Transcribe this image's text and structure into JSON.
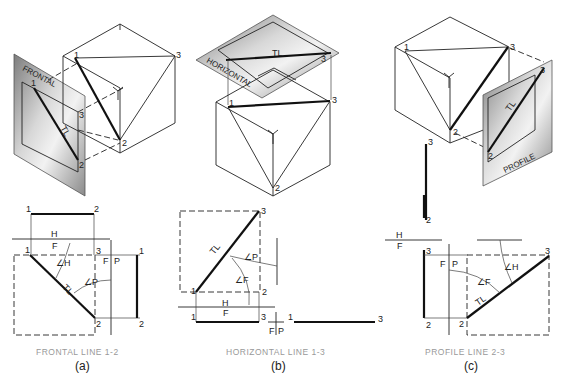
{
  "figure": {
    "panels": [
      {
        "id": "a",
        "caption": "FRONTAL LINE 1-2",
        "sublabel": "(a)",
        "plane_label": "FRONTAL",
        "true_length": "TL",
        "points": {
          "p1": "1",
          "p2": "2",
          "p3": "3"
        },
        "fold_hf": {
          "h": "H",
          "f": "F"
        },
        "fold_fp": {
          "f": "F",
          "p": "P"
        },
        "angles": {
          "h": "∠H",
          "p": "∠P"
        }
      },
      {
        "id": "b",
        "caption": "HORIZONTAL LINE 1-3",
        "sublabel": "(b)",
        "plane_label": "HORIZONTAL",
        "true_length": "TL",
        "points": {
          "p1": "1",
          "p2": "2",
          "p3": "3"
        },
        "fold_hf": {
          "h": "H",
          "f": "F"
        },
        "fold_fp": {
          "f": "F",
          "p": "P"
        },
        "angles": {
          "p": "∠P",
          "f": "∠F"
        }
      },
      {
        "id": "c",
        "caption": "PROFILE LINE 2-3",
        "sublabel": "(c)",
        "plane_label": "PROFILE",
        "true_length": "TL",
        "points": {
          "p1": "1",
          "p2": "2",
          "p3": "3"
        },
        "fold_hf": {
          "h": "H",
          "f": "F"
        },
        "fold_fp": {
          "f": "F",
          "p": "P"
        },
        "angles": {
          "h": "∠H",
          "f": "∠F"
        }
      }
    ],
    "colors": {
      "line": "#222222",
      "caption": "#999999",
      "plane_gray": "#9a9a9a"
    }
  }
}
